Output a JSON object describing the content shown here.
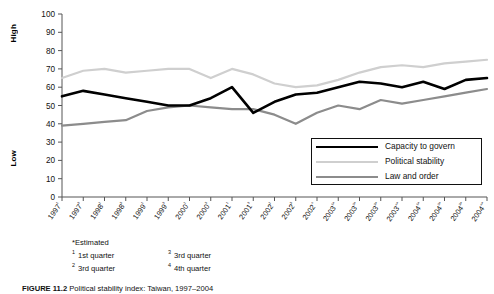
{
  "chart_data": {
    "type": "line",
    "title": "",
    "xlabel": "",
    "ylabel": "",
    "ylim": [
      0,
      100
    ],
    "ytick_step": 10,
    "grid": false,
    "legend_position": "right-center",
    "axis_high_label": "High",
    "axis_low_label": "Low",
    "yticks": [
      100,
      90,
      80,
      70,
      60,
      50,
      40,
      30,
      20,
      10,
      0
    ],
    "categories": [
      "1997¹",
      "1997³",
      "1998¹",
      "1998³",
      "1999¹",
      "1999³",
      "2000¹",
      "2000³",
      "2001¹",
      "2001³",
      "2002¹",
      "2002³",
      "2002⁴",
      "2003¹*",
      "2003²*",
      "2003³*",
      "2003⁴*",
      "2004¹*",
      "2004²*",
      "2004³*",
      "2004⁴*"
    ],
    "series": [
      {
        "name": "Capacity to govern",
        "color": "#000000",
        "width": 2.6,
        "values": [
          55,
          58,
          56,
          54,
          52,
          50,
          50,
          54,
          60,
          46,
          52,
          56,
          57,
          60,
          63,
          62,
          60,
          63,
          59,
          64,
          65
        ]
      },
      {
        "name": "Political stability",
        "color": "#cfcfcf",
        "width": 2.2,
        "values": [
          65,
          69,
          70,
          68,
          69,
          70,
          70,
          65,
          70,
          67,
          62,
          60,
          61,
          64,
          68,
          71,
          72,
          71,
          73,
          74,
          75
        ]
      },
      {
        "name": "Law and order",
        "color": "#8c8c8c",
        "width": 2.2,
        "values": [
          39,
          40,
          41,
          42,
          47,
          49,
          50,
          49,
          48,
          48,
          45,
          40,
          46,
          50,
          48,
          53,
          51,
          53,
          55,
          57,
          59
        ]
      }
    ]
  },
  "legend": {
    "items": [
      {
        "label": "Capacity to govern"
      },
      {
        "label": "Political stability"
      },
      {
        "label": "Law and order"
      }
    ]
  },
  "footnotes": {
    "estimated": "*Estimated",
    "items": [
      {
        "marker": "1",
        "text": "1st quarter"
      },
      {
        "marker": "3",
        "text": "3rd quarter"
      },
      {
        "marker": "2",
        "text": "3rd quarter"
      },
      {
        "marker": "4",
        "text": "4th quarter"
      }
    ]
  },
  "caption": {
    "prefix": "FIGURE 11.2",
    "text": "Political stability index: Taiwan, 1997–2004"
  }
}
